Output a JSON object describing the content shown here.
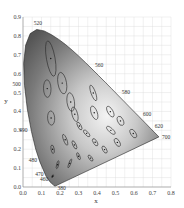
{
  "chart_data": {
    "type": "scatter",
    "title": "",
    "xlabel": "x",
    "ylabel": "y",
    "xlim": [
      0.0,
      0.8
    ],
    "ylim": [
      0.0,
      0.9
    ],
    "grid": true,
    "x_ticks": [
      "0.0",
      "0.1",
      "0.2",
      "0.3",
      "0.4",
      "0.5",
      "0.6",
      "0.7",
      "0.8"
    ],
    "y_ticks": [
      "0.0",
      "0.1",
      "0.2",
      "0.3",
      "0.4",
      "0.5",
      "0.6",
      "0.7",
      "0.8",
      "0.9"
    ],
    "spectral_locus_labels": [
      {
        "label": "380",
        "x": 0.17,
        "y": 0.0
      },
      {
        "label": "460",
        "x": 0.14,
        "y": 0.03
      },
      {
        "label": "470",
        "x": 0.12,
        "y": 0.06
      },
      {
        "label": "480",
        "x": 0.09,
        "y": 0.13
      },
      {
        "label": "490",
        "x": 0.045,
        "y": 0.295
      },
      {
        "label": "500",
        "x": 0.008,
        "y": 0.538
      },
      {
        "label": "520",
        "x": 0.074,
        "y": 0.834
      },
      {
        "label": "560",
        "x": 0.373,
        "y": 0.624
      },
      {
        "label": "580",
        "x": 0.512,
        "y": 0.487
      },
      {
        "label": "600",
        "x": 0.627,
        "y": 0.372
      },
      {
        "label": "620",
        "x": 0.691,
        "y": 0.308
      },
      {
        "label": "700",
        "x": 0.735,
        "y": 0.265
      }
    ],
    "ellipses": [
      {
        "cx": 0.16,
        "cy": 0.057,
        "a": 0.0085,
        "b": 0.0035,
        "angle": 62
      },
      {
        "cx": 0.187,
        "cy": 0.118,
        "a": 0.022,
        "b": 0.0055,
        "angle": 77
      },
      {
        "cx": 0.253,
        "cy": 0.125,
        "a": 0.025,
        "b": 0.005,
        "angle": 70
      },
      {
        "cx": 0.15,
        "cy": 0.68,
        "a": 0.096,
        "b": 0.023,
        "angle": 100
      },
      {
        "cx": 0.131,
        "cy": 0.521,
        "a": 0.047,
        "b": 0.02,
        "angle": 92
      },
      {
        "cx": 0.212,
        "cy": 0.55,
        "a": 0.058,
        "b": 0.023,
        "angle": 100
      },
      {
        "cx": 0.258,
        "cy": 0.45,
        "a": 0.05,
        "b": 0.02,
        "angle": 98
      },
      {
        "cx": 0.152,
        "cy": 0.365,
        "a": 0.038,
        "b": 0.019,
        "angle": 94
      },
      {
        "cx": 0.28,
        "cy": 0.385,
        "a": 0.04,
        "b": 0.015,
        "angle": 105
      },
      {
        "cx": 0.38,
        "cy": 0.498,
        "a": 0.044,
        "b": 0.012,
        "angle": 110
      },
      {
        "cx": 0.16,
        "cy": 0.2,
        "a": 0.023,
        "b": 0.0085,
        "angle": 100
      },
      {
        "cx": 0.228,
        "cy": 0.25,
        "a": 0.031,
        "b": 0.009,
        "angle": 111
      },
      {
        "cx": 0.305,
        "cy": 0.323,
        "a": 0.023,
        "b": 0.009,
        "angle": 118
      },
      {
        "cx": 0.385,
        "cy": 0.393,
        "a": 0.038,
        "b": 0.016,
        "angle": 110
      },
      {
        "cx": 0.472,
        "cy": 0.399,
        "a": 0.032,
        "b": 0.014,
        "angle": 120
      },
      {
        "cx": 0.527,
        "cy": 0.35,
        "a": 0.026,
        "b": 0.015,
        "angle": 115
      },
      {
        "cx": 0.475,
        "cy": 0.3,
        "a": 0.029,
        "b": 0.011,
        "angle": 138
      },
      {
        "cx": 0.51,
        "cy": 0.236,
        "a": 0.024,
        "b": 0.012,
        "angle": 120
      },
      {
        "cx": 0.596,
        "cy": 0.283,
        "a": 0.026,
        "b": 0.013,
        "angle": 122
      },
      {
        "cx": 0.344,
        "cy": 0.284,
        "a": 0.023,
        "b": 0.009,
        "angle": 132
      },
      {
        "cx": 0.39,
        "cy": 0.237,
        "a": 0.022,
        "b": 0.01,
        "angle": 122
      },
      {
        "cx": 0.441,
        "cy": 0.198,
        "a": 0.021,
        "b": 0.01,
        "angle": 120
      },
      {
        "cx": 0.278,
        "cy": 0.223,
        "a": 0.024,
        "b": 0.0085,
        "angle": 115
      },
      {
        "cx": 0.3,
        "cy": 0.163,
        "a": 0.02,
        "b": 0.007,
        "angle": 111
      },
      {
        "cx": 0.365,
        "cy": 0.153,
        "a": 0.019,
        "b": 0.008,
        "angle": 125
      }
    ],
    "colors": {
      "fill_dark": "#5a5a5a",
      "fill_light": "#e8e8e8",
      "outline": "#222222",
      "grid": "#dcdcdc",
      "ellipse": "#2a2a2a"
    }
  },
  "axes": {
    "x_title": "x",
    "y_title": "y"
  }
}
